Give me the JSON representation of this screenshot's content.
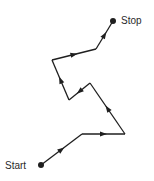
{
  "diagram": {
    "type": "path-walk",
    "start_label": "Start",
    "stop_label": "Stop",
    "line_color": "#1f1f1f",
    "points": [
      {
        "x": 41,
        "y": 165
      },
      {
        "x": 82,
        "y": 134
      },
      {
        "x": 125,
        "y": 134
      },
      {
        "x": 90,
        "y": 83
      },
      {
        "x": 69,
        "y": 100
      },
      {
        "x": 52,
        "y": 60
      },
      {
        "x": 96,
        "y": 49
      },
      {
        "x": 113,
        "y": 21
      }
    ]
  }
}
